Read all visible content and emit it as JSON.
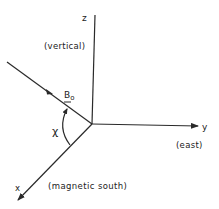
{
  "diagram": {
    "axes": {
      "z": {
        "label": "z",
        "description": "(vertical)"
      },
      "y": {
        "label": "y",
        "description": "(east)"
      },
      "x": {
        "label": "x",
        "description": "(magnetic south)"
      }
    },
    "field_vector": {
      "label": "B",
      "subscript": "o"
    },
    "angle": {
      "label": "χ"
    }
  }
}
